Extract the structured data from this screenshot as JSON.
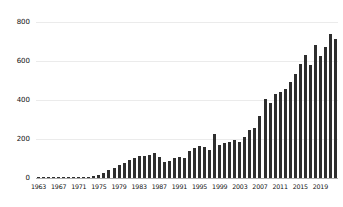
{
  "chart_data": {
    "type": "bar",
    "title": "",
    "xlabel": "",
    "ylabel": "",
    "categories": [
      1963,
      1964,
      1965,
      1966,
      1967,
      1968,
      1969,
      1970,
      1971,
      1972,
      1973,
      1974,
      1975,
      1976,
      1977,
      1978,
      1979,
      1980,
      1981,
      1982,
      1983,
      1984,
      1985,
      1986,
      1987,
      1988,
      1989,
      1990,
      1991,
      1992,
      1993,
      1994,
      1995,
      1996,
      1997,
      1998,
      1999,
      2000,
      2001,
      2002,
      2003,
      2004,
      2005,
      2006,
      2007,
      2008,
      2009,
      2010,
      2011,
      2012,
      2013,
      2014,
      2015,
      2016,
      2017,
      2018,
      2019,
      2020,
      2021,
      2022
    ],
    "values": [
      2,
      2,
      3,
      2,
      3,
      3,
      3,
      4,
      4,
      5,
      6,
      10,
      15,
      25,
      40,
      52,
      66,
      79,
      91,
      104,
      112,
      113,
      117,
      128,
      110,
      84,
      86,
      100,
      108,
      103,
      137,
      154,
      165,
      157,
      146,
      228,
      170,
      180,
      187,
      197,
      184,
      209,
      246,
      255,
      320,
      405,
      385,
      430,
      443,
      458,
      490,
      535,
      585,
      630,
      580,
      680,
      625,
      670,
      740,
      715
    ],
    "y_ticks": [
      0,
      200,
      400,
      600,
      800
    ],
    "x_tick_labels": [
      "1963",
      "1967",
      "1971",
      "1975",
      "1979",
      "1983",
      "1987",
      "1991",
      "1995",
      "1999",
      "2003",
      "2007",
      "2011",
      "2015",
      "2019"
    ],
    "x_tick_years": [
      1963,
      1967,
      1971,
      1975,
      1979,
      1983,
      1987,
      1991,
      1995,
      1999,
      2003,
      2007,
      2011,
      2015,
      2019
    ],
    "ylim": [
      0,
      800
    ],
    "grid": "horizontal",
    "legend": "none",
    "bar_color": "#2e2e2e",
    "grid_color": "#ebebeb",
    "axis_color": "#aaaaaa",
    "label_color": "#111111",
    "background_color": "#ffffff"
  }
}
